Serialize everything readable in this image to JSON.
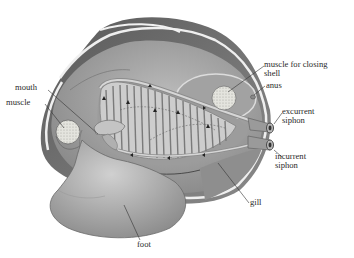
{
  "diagram": {
    "labels": {
      "muscle_closing": "muscle for closing\nshell",
      "anus": "anus",
      "excurrent": "excurrent\nsiphon",
      "incurrent": "incurrent\nsiphon",
      "gill": "gill",
      "foot": "foot",
      "mouth": "mouth",
      "muscle": "muscle"
    },
    "colors": {
      "shell_outer": "#6e6e6e",
      "shell_rim": "#e8e8e8",
      "mantle": "#a9a9a9",
      "body": "#9a9a9a",
      "gill": "#c9c9c9",
      "gill_stripe": "#7c7c7c",
      "foot": "#b4b4b4",
      "muscle_fill": "#e2e2dc",
      "leader": "#333333",
      "text": "#2a2a2a"
    }
  }
}
